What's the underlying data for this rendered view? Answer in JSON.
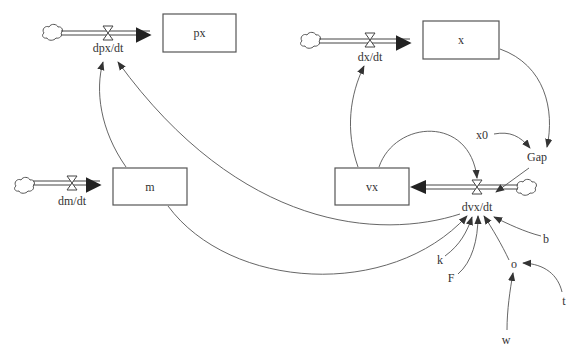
{
  "diagram": {
    "type": "stock-and-flow",
    "stocks": [
      {
        "id": "px",
        "label": "px"
      },
      {
        "id": "x",
        "label": "x"
      },
      {
        "id": "m",
        "label": "m"
      },
      {
        "id": "vx",
        "label": "vx"
      }
    ],
    "flows": [
      {
        "id": "dpx_dt",
        "label": "dpx/dt",
        "to": "px"
      },
      {
        "id": "dx_dt",
        "label": "dx/dt",
        "to": "x"
      },
      {
        "id": "dm_dt",
        "label": "dm/dt",
        "to": "m"
      },
      {
        "id": "dvx_dt",
        "label": "dvx/dt",
        "to": "vx"
      }
    ],
    "auxiliaries": [
      {
        "id": "x0",
        "label": "x0"
      },
      {
        "id": "Gap",
        "label": "Gap"
      },
      {
        "id": "k",
        "label": "k"
      },
      {
        "id": "F",
        "label": "F"
      },
      {
        "id": "b",
        "label": "b"
      },
      {
        "id": "o",
        "label": "o"
      },
      {
        "id": "t",
        "label": "t"
      },
      {
        "id": "w",
        "label": "w"
      }
    ],
    "links": [
      {
        "from": "m",
        "to": "dpx/dt"
      },
      {
        "from": "dvx/dt",
        "to": "dpx/dt"
      },
      {
        "from": "vx",
        "to": "dx/dt"
      },
      {
        "from": "vx",
        "to": "dvx/dt"
      },
      {
        "from": "x",
        "to": "Gap"
      },
      {
        "from": "x0",
        "to": "Gap"
      },
      {
        "from": "Gap",
        "to": "dvx/dt"
      },
      {
        "from": "m",
        "to": "dvx/dt"
      },
      {
        "from": "k",
        "to": "dvx/dt"
      },
      {
        "from": "F",
        "to": "dvx/dt"
      },
      {
        "from": "o",
        "to": "dvx/dt"
      },
      {
        "from": "b",
        "to": "dvx/dt"
      },
      {
        "from": "t",
        "to": "o"
      },
      {
        "from": "w",
        "to": "o"
      }
    ]
  }
}
